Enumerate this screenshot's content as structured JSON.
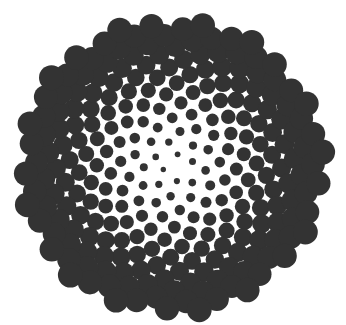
{
  "image": {
    "subject": "phyllotaxis spiral of dark circles",
    "background_color": "#ffffff",
    "dot_color": "#333333"
  },
  "pattern": {
    "type": "vogel-phyllotaxis",
    "center": [
      172,
      166
    ],
    "count": 260,
    "spacing_c": 9.4,
    "golden_angle_deg": 137.508,
    "rotation_deg": 20,
    "min_radius": 2.0,
    "max_radius": 12.5,
    "squash_y": 0.97
  }
}
